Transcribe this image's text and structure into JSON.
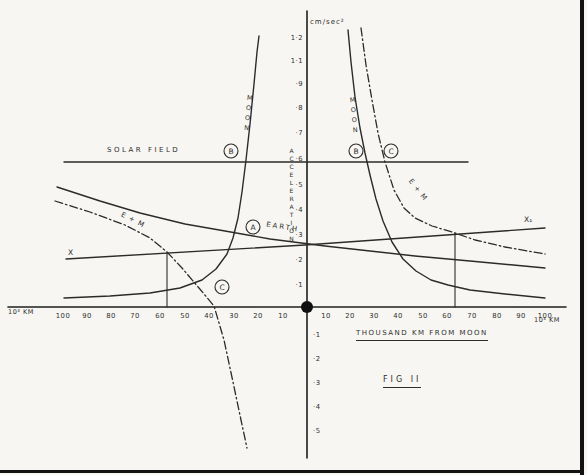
{
  "figure": {
    "caption": "FIG II",
    "x_axis_label": "THOUSAND KM FROM MOON",
    "y_axis_label": "ACCELERATION",
    "y_unit": "cm/sec²",
    "x_unit_left": "10³ KM",
    "x_unit_right": "10³ KM"
  },
  "labels": {
    "solar_field": "SOLAR FIELD",
    "earth": "EARTH",
    "moon_left": "MOON",
    "moon_right": "MOON",
    "e_plus_m_left": "E + M",
    "e_plus_m_right": "E + M",
    "x_left": "X",
    "x_right": "X₁"
  },
  "axis_ticks": {
    "y_positive": [
      "1·2",
      "1·1",
      "·9",
      "·8",
      "·7",
      "·6",
      "·5",
      "·4",
      "·3",
      "·2",
      "·1"
    ],
    "y_negative": [
      "·1",
      "·2",
      "·3",
      "·4",
      "·5"
    ],
    "x_left": [
      "100",
      "90",
      "80",
      "70",
      "60",
      "50",
      "40",
      "30",
      "20",
      "10"
    ],
    "x_right": [
      "10",
      "20",
      "30",
      "40",
      "50",
      "60",
      "70",
      "80",
      "90",
      "100"
    ]
  },
  "markers": [
    {
      "label": "B",
      "x": 231,
      "y": 151
    },
    {
      "label": "A",
      "x": 253,
      "y": 227
    },
    {
      "label": "C",
      "x": 222,
      "y": 287
    },
    {
      "label": "B",
      "x": 356,
      "y": 151
    },
    {
      "label": "C",
      "x": 391,
      "y": 151
    }
  ],
  "chart_data": {
    "type": "line",
    "title": "FIG II",
    "xlabel": "THOUSAND KM FROM MOON (10³ km, moon at origin)",
    "ylabel": "ACCELERATION (cm/sec²)",
    "xlim": [
      -100,
      100
    ],
    "ylim": [
      -0.5,
      1.25
    ],
    "grid": false,
    "origin_marker": "filled dot = Moon at x 0, y 0",
    "series": [
      {
        "name": "SOLAR FIELD",
        "style": "solid",
        "points": [
          [
            -99,
            0.6
          ],
          [
            66,
            0.6
          ]
        ]
      },
      {
        "name": "EARTH (A)",
        "style": "solid",
        "points": [
          [
            -102,
            0.49
          ],
          [
            -68,
            0.39
          ],
          [
            -33,
            0.31
          ],
          [
            0,
            0.25
          ],
          [
            26,
            0.23
          ],
          [
            44,
            0.21
          ],
          [
            67,
            0.19
          ],
          [
            97,
            0.16
          ]
        ]
      },
      {
        "name": "MOON left branch (B)",
        "style": "solid",
        "points": [
          [
            -99,
            0.04
          ],
          [
            -64,
            0.06
          ],
          [
            -43,
            0.11
          ],
          [
            -33,
            0.22
          ],
          [
            -28,
            0.36
          ],
          [
            -25,
            0.61
          ],
          [
            -22,
            0.91
          ],
          [
            -20,
            1.11
          ]
        ]
      },
      {
        "name": "MOON right branch (B)",
        "style": "solid",
        "points": [
          [
            17,
            1.13
          ],
          [
            20,
            0.86
          ],
          [
            24,
            0.63
          ],
          [
            28,
            0.44
          ],
          [
            35,
            0.27
          ],
          [
            45,
            0.15
          ],
          [
            58,
            0.09
          ],
          [
            81,
            0.05
          ],
          [
            97,
            0.04
          ]
        ]
      },
      {
        "name": "E + M left branch (C)",
        "style": "dashdot",
        "points": [
          [
            -103,
            0.43
          ],
          [
            -74,
            0.34
          ],
          [
            -57,
            0.22
          ],
          [
            -44,
            0.08
          ],
          [
            -38,
            0.0
          ],
          [
            -34,
            -0.13
          ],
          [
            -30,
            -0.31
          ],
          [
            -27,
            -0.46
          ],
          [
            -25,
            -0.58
          ]
        ]
      },
      {
        "name": "E + M right branch (C)",
        "style": "dashdot",
        "points": [
          [
            22,
            1.14
          ],
          [
            26,
            0.83
          ],
          [
            32,
            0.59
          ],
          [
            40,
            0.4
          ],
          [
            51,
            0.31
          ],
          [
            69,
            0.27
          ],
          [
            81,
            0.25
          ],
          [
            97,
            0.22
          ]
        ]
      },
      {
        "name": "X – X₁ line",
        "style": "solid",
        "points": [
          [
            -98,
            0.2
          ],
          [
            0,
            0.25
          ],
          [
            97,
            0.32
          ]
        ]
      },
      {
        "name": "equal-field boundary left",
        "style": "vertical",
        "points": [
          [
            -57,
            0
          ],
          [
            -57,
            0.22
          ]
        ]
      },
      {
        "name": "equal-field boundary right",
        "style": "vertical",
        "points": [
          [
            60,
            0
          ],
          [
            60,
            0.3
          ]
        ]
      }
    ]
  },
  "render": {
    "ink": "#2b2b2b",
    "paper": "#f7f6f2",
    "origin_dot": {
      "x": 307,
      "y": 307,
      "r": 6
    },
    "y_tick_x": 303,
    "y_pos_y": [
      38,
      61,
      84,
      108,
      133,
      159,
      185,
      210,
      235,
      260,
      285
    ],
    "y_neg_y": [
      335,
      359,
      383,
      407,
      431
    ],
    "x_tick_y": 318,
    "x_left_x": [
      63,
      87,
      111,
      135,
      160,
      185,
      209,
      234,
      258,
      283
    ],
    "x_right_x": [
      326,
      350,
      374,
      398,
      423,
      447,
      472,
      497,
      521,
      545
    ],
    "curves": [
      {
        "name": "y-axis",
        "style": "axis",
        "points": [
          [
            307,
            11
          ],
          [
            307,
            458
          ]
        ]
      },
      {
        "name": "x-axis",
        "style": "axis",
        "points": [
          [
            8,
            307
          ],
          [
            566,
            307
          ]
        ]
      },
      {
        "name": "solar-field-line",
        "style": "solid",
        "points": [
          [
            64,
            162
          ],
          [
            468,
            162
          ]
        ]
      },
      {
        "name": "earth-curve",
        "style": "solid",
        "points": [
          [
            57,
            187
          ],
          [
            100,
            201
          ],
          [
            140,
            213
          ],
          [
            185,
            224
          ],
          [
            225,
            231
          ],
          [
            270,
            239
          ],
          [
            325,
            246
          ],
          [
            370,
            251
          ],
          [
            415,
            256
          ],
          [
            470,
            261
          ],
          [
            545,
            268
          ]
        ]
      },
      {
        "name": "x-line",
        "style": "solid",
        "points": [
          [
            66,
            259
          ],
          [
            305,
            245
          ],
          [
            545,
            228
          ]
        ]
      },
      {
        "name": "moon-curve-left",
        "style": "solid",
        "points": [
          [
            64,
            298
          ],
          [
            110,
            296
          ],
          [
            150,
            293
          ],
          [
            180,
            288
          ],
          [
            202,
            280
          ],
          [
            216,
            269
          ],
          [
            227,
            254
          ],
          [
            233,
            238
          ],
          [
            238,
            218
          ],
          [
            242,
            192
          ],
          [
            246,
            160
          ],
          [
            250,
            124
          ],
          [
            254,
            84
          ],
          [
            257,
            52
          ],
          [
            259,
            36
          ]
        ]
      },
      {
        "name": "moon-curve-right",
        "style": "solid",
        "points": [
          [
            348,
            30
          ],
          [
            351,
            62
          ],
          [
            355,
            97
          ],
          [
            360,
            128
          ],
          [
            365,
            153
          ],
          [
            370,
            175
          ],
          [
            376,
            199
          ],
          [
            383,
            221
          ],
          [
            392,
            242
          ],
          [
            403,
            259
          ],
          [
            416,
            271
          ],
          [
            431,
            280
          ],
          [
            448,
            285
          ],
          [
            470,
            290
          ],
          [
            505,
            294
          ],
          [
            545,
            298
          ]
        ]
      },
      {
        "name": "e-plus-m-curve-left",
        "style": "dashdot",
        "points": [
          [
            55,
            201
          ],
          [
            90,
            212
          ],
          [
            125,
            225
          ],
          [
            150,
            238
          ],
          [
            167,
            252
          ],
          [
            182,
            268
          ],
          [
            199,
            288
          ],
          [
            214,
            306
          ],
          [
            224,
            340
          ],
          [
            233,
            382
          ],
          [
            241,
            420
          ],
          [
            247,
            448
          ]
        ]
      },
      {
        "name": "e-plus-m-curve-right",
        "style": "dashdot",
        "points": [
          [
            361,
            28
          ],
          [
            366,
            65
          ],
          [
            372,
            100
          ],
          [
            378,
            133
          ],
          [
            385,
            162
          ],
          [
            394,
            190
          ],
          [
            404,
            208
          ],
          [
            415,
            218
          ],
          [
            432,
            226
          ],
          [
            452,
            232
          ],
          [
            475,
            240
          ],
          [
            505,
            247
          ],
          [
            545,
            254
          ]
        ]
      },
      {
        "name": "boundary-left",
        "style": "thin",
        "points": [
          [
            167,
            253
          ],
          [
            167,
            307
          ]
        ]
      },
      {
        "name": "boundary-right",
        "style": "thin",
        "points": [
          [
            455,
            233
          ],
          [
            455,
            307
          ]
        ]
      }
    ]
  }
}
